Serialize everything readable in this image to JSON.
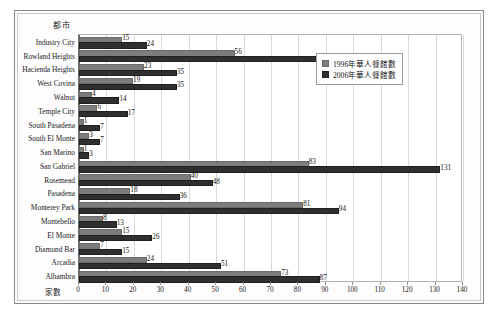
{
  "chart_data": {
    "type": "bar",
    "orientation": "horizontal",
    "title": "",
    "xlabel": "家數",
    "ylabel": "都市",
    "xlim": [
      0,
      140
    ],
    "xticks": [
      0,
      10,
      20,
      30,
      40,
      50,
      60,
      70,
      80,
      90,
      100,
      110,
      120,
      130,
      140
    ],
    "grid": true,
    "legend_position": "upper-right-inside",
    "categories": [
      "Industry City",
      "Rowland Heights",
      "Hacienda Heights",
      "West Covina",
      "Walnut",
      "Temple City",
      "South Pasadena",
      "South El Monte",
      "San Marino",
      "San Gabriel",
      "Rosemead",
      "Pasadena",
      "Monterey Park",
      "Montebello",
      "El Monte",
      "Diamond Bar",
      "Arcadia",
      "Alhambra"
    ],
    "series": [
      {
        "name": "1996年華人餐館數",
        "color": "#7d7d7d",
        "values": [
          15,
          56,
          23,
          19,
          4,
          6,
          1,
          3,
          1,
          83,
          40,
          18,
          81,
          8,
          15,
          7,
          24,
          73
        ]
      },
      {
        "name": "2006年華人餐館數",
        "color": "#2f2f2f",
        "values": [
          24,
          87,
          35,
          35,
          14,
          17,
          7,
          7,
          3,
          131,
          48,
          36,
          94,
          13,
          26,
          15,
          51,
          87
        ]
      }
    ]
  },
  "legend": {
    "items": [
      {
        "label": "1996年華人餐館數",
        "swatch": "legend-swatch-1996"
      },
      {
        "label": "2006年華人餐館數",
        "swatch": "legend-swatch-2006"
      }
    ]
  }
}
